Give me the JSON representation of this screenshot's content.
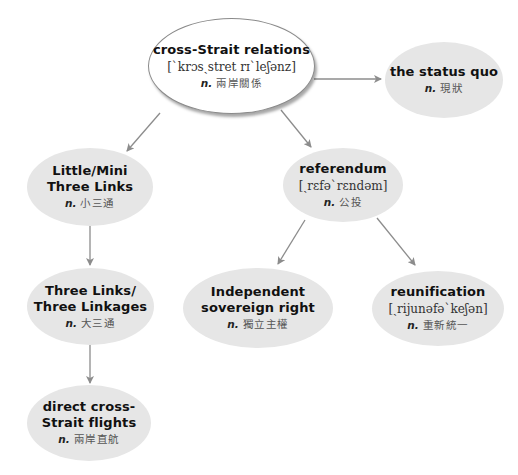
{
  "diagram": {
    "edge_color": "#8c8c8c",
    "node_fill": "#e6e6e6",
    "root_fill": "#ffffff",
    "nodes": {
      "root": {
        "term": "cross-Strait relations",
        "phonetic": "[ˋkrɔsˏstret rɪˋleʃənz]",
        "pos": "n.",
        "chinese": "兩岸關係"
      },
      "status_quo": {
        "term": "the status quo",
        "pos": "n.",
        "chinese": "現狀"
      },
      "mini_three_links": {
        "term": "Little/Mini\nThree Links",
        "pos": "n.",
        "chinese": "小三通"
      },
      "referendum": {
        "term": "referendum",
        "phonetic": "[ˏrɛfəˋrɛndəm]",
        "pos": "n.",
        "chinese": "公投"
      },
      "three_links": {
        "term": "Three Links/\nThree Linkages",
        "pos": "n.",
        "chinese": "大三通"
      },
      "independent_sovereign_right": {
        "term": "Independent\nsovereign right",
        "pos": "n.",
        "chinese": "獨立主權"
      },
      "reunification": {
        "term": "reunification",
        "phonetic": "[ˏrijunəfəˋkeʃən]",
        "pos": "n.",
        "chinese": "重新統一"
      },
      "direct_flights": {
        "term": "direct cross-\nStrait flights",
        "pos": "n.",
        "chinese": "兩岸直航"
      }
    },
    "edges": [
      {
        "from": "cross-Strait relations",
        "to": "the status quo"
      },
      {
        "from": "cross-Strait relations",
        "to": "Little/Mini Three Links"
      },
      {
        "from": "cross-Strait relations",
        "to": "referendum"
      },
      {
        "from": "Little/Mini Three Links",
        "to": "Three Links/Three Linkages"
      },
      {
        "from": "Three Links/Three Linkages",
        "to": "direct cross-Strait flights"
      },
      {
        "from": "referendum",
        "to": "Independent sovereign right"
      },
      {
        "from": "referendum",
        "to": "reunification"
      }
    ]
  }
}
